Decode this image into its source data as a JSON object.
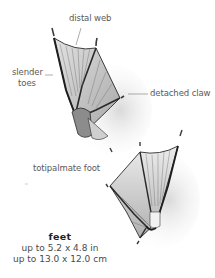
{
  "labels": {
    "distal_web": "distal web",
    "slender_toes_line1": "slender",
    "slender_toes_line2": "toes",
    "detached_claw": "detached claw",
    "totipalmate_foot": "totipalmate foot"
  },
  "caption": {
    "title": "feet",
    "size_in": "up to 5.2 x 4.8 in",
    "size_cm": "up to 13.0 x 12.0 cm"
  },
  "colors": {
    "ink": "#2a2a2a",
    "web_fill": "#d9d9d9",
    "shadow": "#bdbdbd",
    "leader_line": "#8a8a8a"
  }
}
